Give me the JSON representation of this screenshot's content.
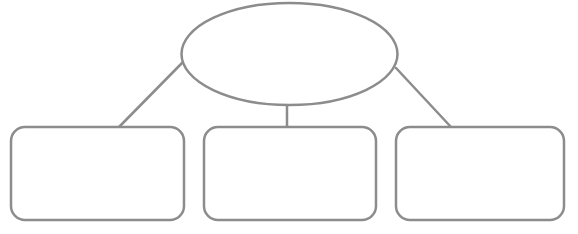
{
  "diagram": {
    "type": "hierarchy",
    "stroke_color": "#8c8c8c",
    "fill_color": "#ffffff",
    "background": "#ffffff",
    "root": {
      "shape": "ellipse",
      "label": "",
      "cx": 289.5,
      "cy": 54,
      "rx": 108,
      "ry": 51
    },
    "children": [
      {
        "shape": "rounded-rect",
        "label": "",
        "x": 11,
        "y": 127,
        "w": 173,
        "h": 93,
        "r": 14
      },
      {
        "shape": "rounded-rect",
        "label": "",
        "x": 204,
        "y": 127,
        "w": 172,
        "h": 93,
        "r": 14
      },
      {
        "shape": "rounded-rect",
        "label": "",
        "x": 396,
        "y": 127,
        "w": 168,
        "h": 93,
        "r": 14
      }
    ],
    "connectors": [
      {
        "from": "root",
        "to": "child-1",
        "x1": 183,
        "y1": 62,
        "x2": 119,
        "y2": 127
      },
      {
        "from": "root",
        "to": "child-2",
        "x1": 287,
        "y1": 105,
        "x2": 287,
        "y2": 127
      },
      {
        "from": "root",
        "to": "child-3",
        "x1": 396,
        "y1": 68,
        "x2": 451,
        "y2": 127
      }
    ]
  }
}
